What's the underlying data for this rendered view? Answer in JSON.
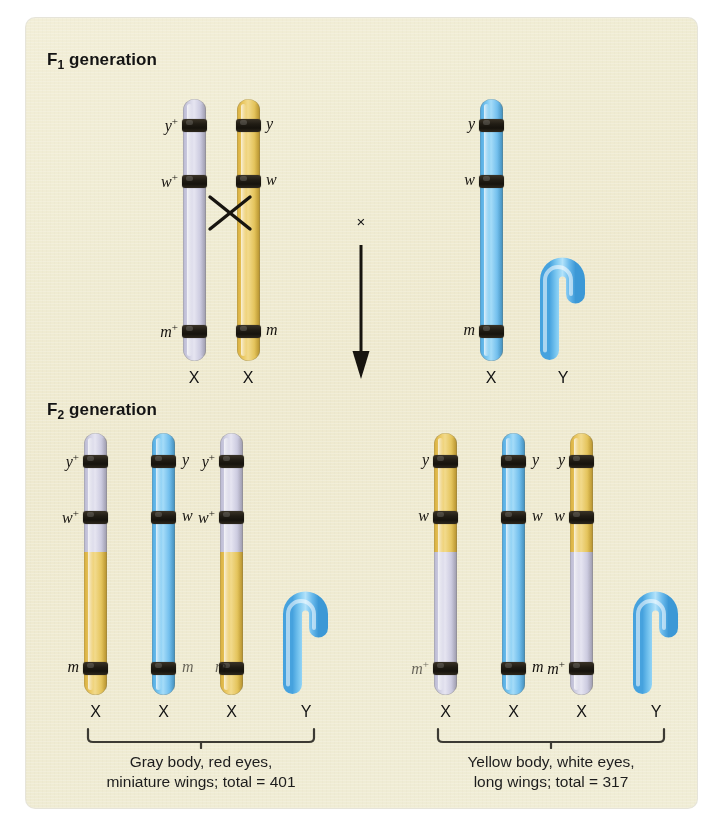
{
  "figure": {
    "background_color": "#f7f5e7",
    "page_color": "#ffffff"
  },
  "f1": {
    "title_prefix": "F",
    "title_sub": "1",
    "title_suffix": " generation",
    "cross_symbol": "×",
    "female": {
      "chromosomes": [
        {
          "id": "f1-female-chr1",
          "color": "lavender",
          "color_hex": "#d6d5e6",
          "labels_side": "left",
          "alleles": [
            {
              "gene": "y",
              "superscript": "+"
            },
            {
              "gene": "w",
              "superscript": "+"
            },
            {
              "gene": "m",
              "superscript": "+"
            }
          ],
          "type_label": "X"
        },
        {
          "id": "f1-female-chr2",
          "color": "yellow",
          "color_hex": "#ebc964",
          "labels_side": "right",
          "alleles": [
            {
              "gene": "y",
              "superscript": ""
            },
            {
              "gene": "w",
              "superscript": ""
            },
            {
              "gene": "m",
              "superscript": ""
            }
          ],
          "type_label": "X"
        }
      ],
      "crossover_mark": "X"
    },
    "male": {
      "chromosomes": [
        {
          "id": "f1-male-chrX",
          "color": "blue",
          "color_hex": "#79c6f0",
          "labels_side": "left",
          "alleles": [
            {
              "gene": "y",
              "superscript": ""
            },
            {
              "gene": "w",
              "superscript": ""
            },
            {
              "gene": "m",
              "superscript": ""
            }
          ],
          "type_label": "X"
        }
      ],
      "y_chromosome": {
        "id": "f1-male-chrY",
        "color": "blue",
        "color_hex": "#79c6f0",
        "type_label": "Y"
      }
    }
  },
  "f2": {
    "title_prefix": "F",
    "title_sub": "2",
    "title_suffix": " generation",
    "left_group": {
      "chromosomes": [
        {
          "id": "f2-left-chr1",
          "top_color": "lavender",
          "bottom_color": "yellow",
          "labels_side": "left",
          "alleles": [
            {
              "gene": "y",
              "superscript": "+"
            },
            {
              "gene": "w",
              "superscript": "+"
            },
            {
              "gene": "m",
              "superscript": ""
            }
          ],
          "type_label": "X"
        },
        {
          "id": "f2-left-chr2",
          "top_color": "blue",
          "bottom_color": "blue",
          "labels_side": "right",
          "alleles": [
            {
              "gene": "y",
              "superscript": ""
            },
            {
              "gene": "w",
              "superscript": ""
            },
            {
              "gene": "m",
              "superscript": ""
            }
          ],
          "type_label": "X"
        },
        {
          "id": "f2-left-chr3",
          "top_color": "lavender",
          "bottom_color": "yellow",
          "labels_side": "left",
          "alleles": [
            {
              "gene": "y",
              "superscript": "+"
            },
            {
              "gene": "w",
              "superscript": "+"
            },
            {
              "gene": "m",
              "superscript": ""
            }
          ],
          "type_label": "X"
        }
      ],
      "y_chromosome": {
        "id": "f2-left-chrY",
        "color": "blue",
        "color_hex": "#79c6f0",
        "type_label": "Y"
      },
      "caption": "Gray body, red eyes,\nminiature wings; total = 401",
      "total": 401
    },
    "right_group": {
      "chromosomes": [
        {
          "id": "f2-right-chr1",
          "top_color": "yellow",
          "bottom_color": "lavender",
          "labels_side": "left",
          "alleles": [
            {
              "gene": "y",
              "superscript": ""
            },
            {
              "gene": "w",
              "superscript": ""
            },
            {
              "gene": "m",
              "superscript": "+"
            }
          ],
          "type_label": "X"
        },
        {
          "id": "f2-right-chr2",
          "top_color": "blue",
          "bottom_color": "blue",
          "labels_side": "right",
          "alleles": [
            {
              "gene": "y",
              "superscript": ""
            },
            {
              "gene": "w",
              "superscript": ""
            },
            {
              "gene": "m",
              "superscript": ""
            }
          ],
          "type_label": "X"
        },
        {
          "id": "f2-right-chr3",
          "top_color": "yellow",
          "bottom_color": "lavender",
          "labels_side": "left",
          "alleles": [
            {
              "gene": "y",
              "superscript": ""
            },
            {
              "gene": "w",
              "superscript": ""
            },
            {
              "gene": "m",
              "superscript": "+"
            }
          ],
          "type_label": "X"
        }
      ],
      "y_chromosome": {
        "id": "f2-right-chrY",
        "color": "blue",
        "color_hex": "#79c6f0",
        "type_label": "Y"
      },
      "caption": "Yellow body, white eyes,\nlong wings; total = 317",
      "total": 317
    }
  },
  "labels": {
    "f1_title": "F1 generation",
    "f2_title": "F2 generation",
    "x_chromosome": "X",
    "y_chromosome": "Y",
    "cross": "×",
    "crossover": "X",
    "y_plus": "y+",
    "y_allele": "y",
    "w_plus": "w+",
    "w_allele": "w",
    "m_plus": "m+",
    "m_allele": "m"
  }
}
